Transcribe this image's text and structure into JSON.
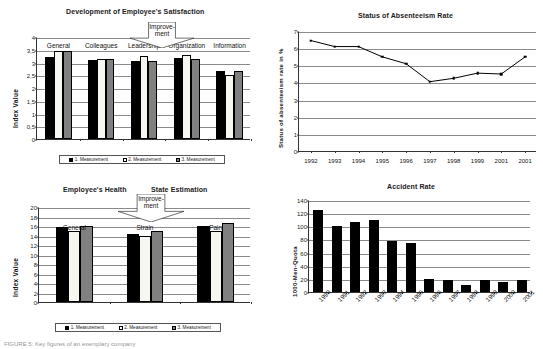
{
  "page": {
    "caption": "FIGURE 5: Key figures of an exemplary company"
  },
  "charts": {
    "satisfaction": {
      "title": "Development of Employee's Satisfaction",
      "ylabel": "Index Value",
      "callout": "Improve-\nment",
      "callout_line1": "Improve-",
      "callout_line2": "ment",
      "legend": [
        "1. Measurement",
        "2. Measurement",
        "3. Measurement"
      ],
      "yticks": [
        "0",
        "0,5",
        "1",
        "1,5",
        "2",
        "2,5",
        "3",
        "3,5",
        "4"
      ]
    },
    "absenteeism": {
      "title": "Status of Absenteeism Rate",
      "ylabel": "Status of absenteeism rate in %",
      "yticks": [
        "0",
        "1",
        "2",
        "3",
        "4",
        "5",
        "6",
        "7"
      ]
    },
    "health": {
      "title_left": "Employee's Health",
      "title_right": "State Estimation",
      "ylabel": "Index  Value",
      "callout_line1": "Improve-",
      "callout_line2": "ment",
      "legend": [
        "1. Measurement",
        "2. Measurement",
        "3. Measurement"
      ],
      "yticks": [
        "0",
        "2",
        "4",
        "6",
        "8",
        "10",
        "12",
        "14",
        "16",
        "18",
        "20"
      ]
    },
    "accident": {
      "title": "Accident Rate",
      "ylabel": "1000-Men-Quota",
      "yticks": [
        "0",
        "20",
        "40",
        "60",
        "80",
        "100",
        "120",
        "140"
      ]
    }
  },
  "chart_data": [
    {
      "id": "satisfaction",
      "type": "bar",
      "title": "Development of Employee's Satisfaction",
      "xlabel": "",
      "ylabel": "Index Value",
      "ylim": [
        0,
        4
      ],
      "ytick_step": 0.5,
      "grid": true,
      "legend_position": "bottom",
      "categories": [
        "General",
        "Colleagues",
        "Leadership",
        "Organization",
        "Information"
      ],
      "series": [
        {
          "name": "1. Measurement",
          "color": "#000000",
          "values": [
            3.22,
            3.08,
            3.05,
            3.18,
            2.65
          ]
        },
        {
          "name": "2. Measurement",
          "color": "#f7f7f2",
          "values": [
            3.47,
            3.15,
            3.25,
            3.3,
            2.5
          ]
        },
        {
          "name": "3. Measurement",
          "color": "#808080",
          "values": [
            3.47,
            3.12,
            3.05,
            3.15,
            2.68
          ]
        }
      ],
      "annotations": [
        {
          "text": "Improve-ment",
          "type": "callout-banner"
        }
      ]
    },
    {
      "id": "absenteeism",
      "type": "line",
      "title": "Status of Absenteeism Rate",
      "xlabel": "",
      "ylabel": "Status of absenteeism rate in %",
      "ylim": [
        0,
        7
      ],
      "ytick_step": 1,
      "grid": true,
      "legend_position": "none",
      "categories": [
        "1992",
        "1993",
        "1994",
        "1995",
        "1996",
        "1997",
        "1998",
        "1999",
        "2001",
        "2001"
      ],
      "values": [
        6.5,
        6.15,
        6.15,
        5.55,
        5.15,
        4.1,
        4.3,
        4.6,
        4.55,
        5.55
      ]
    },
    {
      "id": "health",
      "type": "bar",
      "title": "Employee's Health State Estimation",
      "xlabel": "",
      "ylabel": "Index  Value",
      "ylim": [
        0,
        20
      ],
      "ytick_step": 2,
      "grid": true,
      "legend_position": "bottom",
      "categories": [
        "General",
        "Strain",
        "Pain"
      ],
      "series": [
        {
          "name": "1. Measurement",
          "color": "#000000",
          "values": [
            15.8,
            14.3,
            16.0
          ]
        },
        {
          "name": "2. Measurement",
          "color": "#f7f7f2",
          "values": [
            15.0,
            14.0,
            15.0
          ]
        },
        {
          "name": "3. Measurement",
          "color": "#808080",
          "values": [
            16.0,
            15.0,
            16.7
          ]
        }
      ],
      "annotations": [
        {
          "text": "Improve-ment",
          "type": "callout-banner"
        }
      ]
    },
    {
      "id": "accident",
      "type": "bar",
      "title": "Accident Rate",
      "xlabel": "",
      "ylabel": "1000-Men-Quota",
      "ylim": [
        0,
        140
      ],
      "ytick_step": 20,
      "grid": true,
      "legend_position": "none",
      "categories": [
        "1990",
        "1991",
        "1992",
        "1993",
        "1994",
        "1995",
        "1996",
        "1997",
        "1998",
        "1999",
        "2000",
        "2001"
      ],
      "values": [
        125,
        100,
        107,
        110,
        77,
        74,
        20,
        18,
        10,
        18,
        16,
        18
      ]
    }
  ]
}
